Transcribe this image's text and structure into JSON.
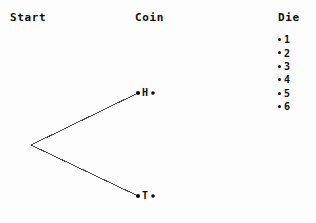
{
  "diagram": {
    "type": "probability-tree",
    "headers": [
      {
        "name": "start",
        "label": "Start"
      },
      {
        "name": "coin",
        "label": "Coin"
      },
      {
        "name": "die",
        "label": "Die"
      }
    ],
    "stroke_color": "#4a4a4a",
    "node_color": "#0d0d0d",
    "background": "#fdfdfd",
    "root": {
      "x": 31,
      "y": 145
    },
    "branches": [
      {
        "name": "heads",
        "label": "H",
        "x": 138,
        "y": 93,
        "trailing_dot_x": 153
      },
      {
        "name": "tails",
        "label": "T",
        "x": 138,
        "y": 196,
        "trailing_dot_x": 153
      }
    ],
    "die_outcomes": [
      {
        "bullet": "•",
        "value": "1"
      },
      {
        "bullet": "•",
        "value": "2"
      },
      {
        "bullet": "•",
        "value": "3"
      },
      {
        "bullet": "•",
        "value": "4"
      },
      {
        "bullet": "•",
        "value": "5"
      },
      {
        "bullet": "•",
        "value": "6"
      }
    ]
  }
}
